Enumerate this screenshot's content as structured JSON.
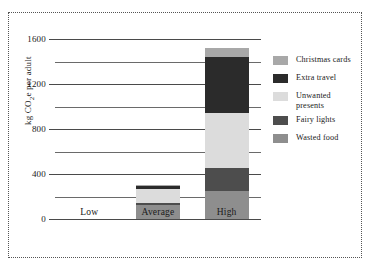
{
  "chart_data": {
    "type": "bar",
    "subtype": "stacked-bar",
    "title": "",
    "xlabel": "",
    "ylabel": "kg CO2e per adult",
    "ylabel_html": "kg CO|2|e per adult",
    "categories": [
      "Low",
      "Average",
      "High"
    ],
    "ylim": [
      0,
      1600
    ],
    "yticks": [
      0,
      400,
      800,
      1200,
      1600
    ],
    "ytick_labels": [
      "0",
      "400",
      "800",
      "1200",
      "1600"
    ],
    "minor_gridlines": [
      200,
      600,
      1000,
      1400
    ],
    "grid": true,
    "legend_position": "right",
    "series": [
      {
        "name": "Wasted food",
        "color": "#8e8e8e",
        "values": [
          0,
          125,
          245
        ]
      },
      {
        "name": "Fairy lights",
        "color": "#4d4d4d",
        "values": [
          0,
          15,
          210
        ]
      },
      {
        "name": "Unwanted presents",
        "color": "#dcdcdc",
        "values": [
          0,
          125,
          485
        ]
      },
      {
        "name": "Extra travel",
        "color": "#2b2b2b",
        "values": [
          0,
          25,
          500
        ]
      },
      {
        "name": "Christmas cards",
        "color": "#a8a8a8",
        "values": [
          0,
          10,
          80
        ]
      }
    ],
    "totals": [
      0,
      300,
      1520
    ],
    "stack_order_bottom_to_top": [
      "Wasted food",
      "Fairy lights",
      "Unwanted presents",
      "Extra travel",
      "Christmas cards"
    ]
  },
  "legend": {
    "items": [
      {
        "label": "Christmas cards",
        "color": "#a8a8a8"
      },
      {
        "label": "Extra travel",
        "color": "#2b2b2b"
      },
      {
        "label": "Unwanted\npresents",
        "color": "#dcdcdc"
      },
      {
        "label": "Fairy lights",
        "color": "#4d4d4d"
      },
      {
        "label": "Wasted food",
        "color": "#8e8e8e"
      }
    ]
  },
  "axis": {
    "y_title_prefix": "kg CO",
    "y_title_sub": "2",
    "y_title_suffix": "e per adult"
  }
}
